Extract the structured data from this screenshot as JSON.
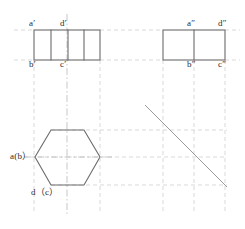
{
  "drawing": {
    "title": "Orthographic three-view projection of a hexagonal prism",
    "colors": {
      "outline": "#6b6b6b",
      "centerline": "#b9b9b9",
      "projection": "#c9c9c9",
      "miter": "#9a9a9a",
      "label": "#2b2b2b",
      "background": "#ffffff"
    },
    "labels": [
      {
        "id": "a-prime",
        "text": "a′",
        "x": 29,
        "y": 23
      },
      {
        "id": "d-prime",
        "text": "d′",
        "x": 60,
        "y": 23
      },
      {
        "id": "b-prime",
        "text": "b′",
        "x": 29,
        "y": 62
      },
      {
        "id": "c-prime",
        "text": "c′",
        "x": 60,
        "y": 62
      },
      {
        "id": "a-double-prime",
        "text": "a″",
        "x": 186,
        "y": 23
      },
      {
        "id": "d-double-prime",
        "text": "d″",
        "x": 218,
        "y": 23
      },
      {
        "id": "b-double-prime",
        "text": "b″",
        "x": 186,
        "y": 62
      },
      {
        "id": "c-double-prime",
        "text": "c″",
        "x": 218,
        "y": 62
      },
      {
        "id": "a-b-top",
        "text": "a(b）",
        "x": 10,
        "y": 153
      },
      {
        "id": "d-c-top",
        "text": "d（c）",
        "x": 31,
        "y": 190
      }
    ],
    "views": {
      "front": {
        "name": "front-view",
        "rect": {
          "x": 34,
          "y": 30,
          "w": 66,
          "h": 30
        },
        "internal_verticals_x": [
          51,
          68,
          84
        ]
      },
      "side": {
        "name": "side-view",
        "rect": {
          "x": 163,
          "y": 30,
          "w": 62,
          "h": 30
        },
        "internal_verticals_x": [
          194
        ]
      },
      "top": {
        "name": "top-view-hexagon",
        "center": {
          "x": 67,
          "y": 157
        },
        "vertices": [
          {
            "x": 35,
            "y": 157
          },
          {
            "x": 51,
            "y": 130
          },
          {
            "x": 84,
            "y": 130
          },
          {
            "x": 100,
            "y": 157
          },
          {
            "x": 84,
            "y": 185
          },
          {
            "x": 51,
            "y": 185
          }
        ]
      }
    },
    "miter_line": {
      "name": "45-degree-miter-line",
      "x1": 145,
      "y1": 105,
      "x2": 227,
      "y2": 187
    },
    "centerlines": {
      "vertical_main": {
        "x": 67,
        "y1": 14,
        "y2": 214
      },
      "horizontal_top_view": {
        "y": 157,
        "x1": 24,
        "x2": 112
      }
    },
    "projection_lines": {
      "verticals_x": [
        34,
        100,
        163,
        194,
        225
      ],
      "horizontals_y": [
        30,
        60,
        130,
        157,
        185
      ]
    }
  }
}
